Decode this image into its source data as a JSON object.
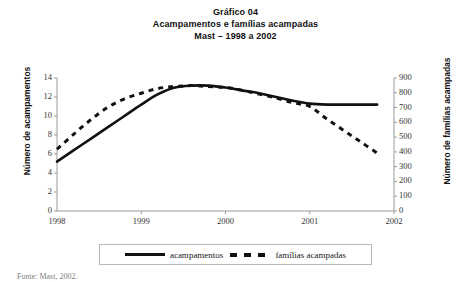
{
  "title": {
    "line1": "Gráfico 04",
    "line2": "Acampamentos e famílias acampadas",
    "line3": "Mast – 1998 a 2002"
  },
  "source_note": "Fonte: Mast, 2002.",
  "legend": {
    "item1": "acampamentos",
    "item2": "famílias acampadas"
  },
  "axes": {
    "y_left_title": "Número de acampamentos",
    "y_right_title": "Número de famílias acampadas",
    "y_left_ticks": [
      "14",
      "12",
      "10",
      "8",
      "6",
      "4",
      "2",
      "0"
    ],
    "y_right_ticks": [
      "900",
      "800",
      "700",
      "600",
      "500",
      "400",
      "300",
      "200",
      "100",
      "0"
    ],
    "x_ticks": [
      "1998",
      "1999",
      "2000",
      "2001",
      "2002"
    ]
  },
  "colors": {
    "line": "#111111",
    "axis": "#9a9a9a",
    "text": "#1a1a1a",
    "background": "#ffffff"
  },
  "chart_data": {
    "type": "line",
    "xlabel": "",
    "ylabel": "Número de acampamentos",
    "y2label": "Número de famílias acampadas",
    "xlim": [
      1998,
      2002
    ],
    "ylim": [
      0,
      14
    ],
    "y2lim": [
      0,
      900
    ],
    "grid": false,
    "legend_position": "bottom",
    "x": [
      1998.0,
      1998.2,
      1998.4,
      1998.6,
      1998.8,
      1999.0,
      1999.2,
      1999.4,
      1999.6,
      1999.8,
      2000.0,
      2000.2,
      2000.4,
      2000.6,
      2000.8,
      2001.0,
      2001.2,
      2001.4,
      2001.6,
      2001.8
    ],
    "series": [
      {
        "name": "acampamentos",
        "style": "solid",
        "axis": "left",
        "values": [
          5.2,
          6.4,
          7.6,
          8.8,
          10.0,
          11.2,
          12.3,
          13.0,
          13.2,
          13.2,
          13.0,
          12.7,
          12.4,
          12.0,
          11.6,
          11.3,
          11.2,
          11.2,
          11.2,
          11.2
        ]
      },
      {
        "name": "famílias acampadas",
        "style": "dashed",
        "axis": "right",
        "values_right_scale": [
          420,
          520,
          620,
          700,
          760,
          800,
          830,
          845,
          850,
          845,
          835,
          815,
          790,
          765,
          735,
          705,
          625,
          545,
          470,
          390
        ],
        "values_left_equivalent": [
          6.5,
          8.1,
          9.6,
          10.9,
          11.8,
          12.4,
          12.9,
          13.1,
          13.2,
          13.1,
          13.0,
          12.7,
          12.3,
          11.9,
          11.4,
          11.0,
          9.7,
          8.5,
          7.3,
          6.1
        ]
      }
    ]
  }
}
